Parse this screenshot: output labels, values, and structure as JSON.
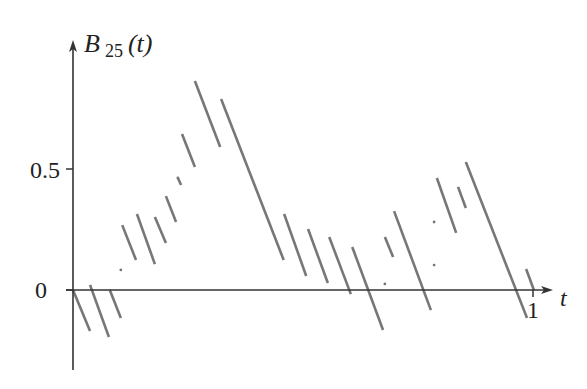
{
  "chart_data": {
    "type": "line",
    "title": "",
    "ylabel": "B_25(t)",
    "ylabel_main": "B",
    "ylabel_sub": "25",
    "ylabel_arg": "(t)",
    "xlabel": "t",
    "xticks": [
      {
        "value": 1,
        "label": "1"
      }
    ],
    "yticks": [
      {
        "value": 0,
        "label": "0"
      },
      {
        "value": 0.5,
        "label": "0.5"
      }
    ],
    "xlim": [
      0,
      1.02
    ],
    "ylim": [
      -0.3,
      1.05
    ],
    "grid": false,
    "legend": null,
    "series": [
      {
        "name": "B_25(t) (piecewise linear, slope ~ -5.4)",
        "color": "#777777",
        "segments": [
          [
            [
              0.0,
              0.0
            ],
            [
              0.037,
              -0.169
            ]
          ],
          [
            [
              0.037,
              0.021
            ],
            [
              0.078,
              -0.194
            ]
          ],
          [
            [
              0.08,
              0.0
            ],
            [
              0.104,
              -0.116
            ]
          ],
          [
            [
              0.107,
              0.268
            ],
            [
              0.137,
              0.124
            ]
          ],
          [
            [
              0.139,
              0.314
            ],
            [
              0.178,
              0.107
            ]
          ],
          [
            [
              0.178,
              0.302
            ],
            [
              0.202,
              0.194
            ]
          ],
          [
            [
              0.202,
              0.388
            ],
            [
              0.224,
              0.281
            ]
          ],
          [
            [
              0.228,
              0.463
            ],
            [
              0.235,
              0.434
            ]
          ],
          [
            [
              0.237,
              0.645
            ],
            [
              0.265,
              0.508
            ]
          ],
          [
            [
              0.265,
              0.864
            ],
            [
              0.32,
              0.591
            ]
          ],
          [
            [
              0.322,
              0.789
            ],
            [
              0.458,
              0.124
            ]
          ],
          [
            [
              0.459,
              0.314
            ],
            [
              0.507,
              0.058
            ]
          ],
          [
            [
              0.511,
              0.252
            ],
            [
              0.554,
              0.029
            ]
          ],
          [
            [
              0.557,
              0.219
            ],
            [
              0.604,
              -0.017
            ]
          ],
          [
            [
              0.607,
              0.178
            ],
            [
              0.674,
              -0.165
            ]
          ],
          [
            [
              0.678,
              0.219
            ],
            [
              0.696,
              0.136
            ]
          ],
          [
            [
              0.698,
              0.326
            ],
            [
              0.778,
              -0.083
            ]
          ],
          [
            [
              0.791,
              0.463
            ],
            [
              0.833,
              0.236
            ]
          ],
          [
            [
              0.837,
              0.426
            ],
            [
              0.854,
              0.339
            ]
          ],
          [
            [
              0.854,
              0.529
            ],
            [
              0.987,
              -0.116
            ]
          ],
          [
            [
              0.985,
              0.087
            ],
            [
              1.002,
              0.0
            ]
          ]
        ],
        "dots": [
          [
            0.104,
            0.083
          ],
          [
            0.228,
            0.463
          ],
          [
            0.678,
            0.025
          ],
          [
            0.785,
            0.103
          ],
          [
            0.785,
            0.281
          ]
        ]
      }
    ]
  }
}
